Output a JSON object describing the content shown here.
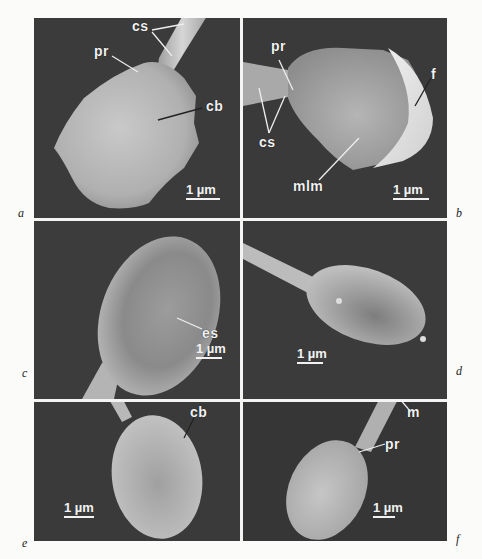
{
  "figure": {
    "panels": [
      {
        "id": "a",
        "letter": "a",
        "labels": [
          "cs",
          "pr",
          "cb"
        ],
        "scale_bar": "1 µm"
      },
      {
        "id": "b",
        "letter": "b",
        "labels": [
          "pr",
          "f",
          "cs",
          "mlm"
        ],
        "scale_bar": "1 µm"
      },
      {
        "id": "c",
        "letter": "c",
        "labels": [
          "es"
        ],
        "scale_bar": "1 µm"
      },
      {
        "id": "d",
        "letter": "d",
        "labels": [],
        "scale_bar": "1 µm"
      },
      {
        "id": "e",
        "letter": "e",
        "labels": [
          "cb"
        ],
        "scale_bar": "1 µm"
      },
      {
        "id": "f",
        "letter": "f",
        "labels": [
          "m",
          "pr"
        ],
        "scale_bar": "1 µm"
      }
    ]
  },
  "colors": {
    "background": "#fbfbfa",
    "micrograph_bg": "#3a3a3a",
    "specimen": "#bdbdbd",
    "label_text": "#f2f2f2"
  }
}
